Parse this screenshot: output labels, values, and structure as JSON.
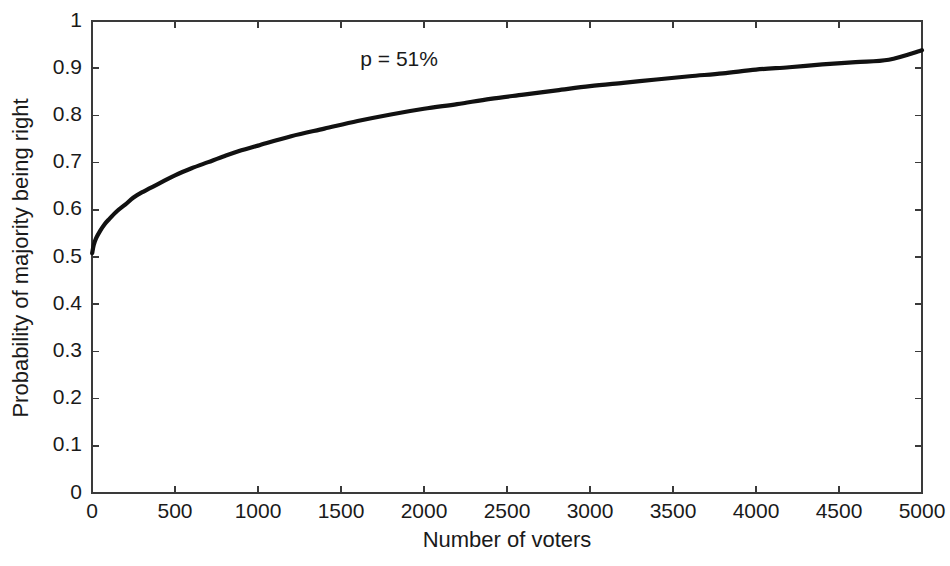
{
  "chart_data": {
    "type": "line",
    "title": "",
    "xlabel": "Number of voters",
    "ylabel": "Probability of majority being right",
    "xlim": [
      0,
      5000
    ],
    "ylim": [
      0,
      1
    ],
    "grid": false,
    "legend": null,
    "xticks": [
      0,
      500,
      1000,
      1500,
      2000,
      2500,
      3000,
      3500,
      4000,
      4500,
      5000
    ],
    "xticklabels": [
      "0",
      "500",
      "1000",
      "1500",
      "2000",
      "2500",
      "3000",
      "3500",
      "4000",
      "4500",
      "5000"
    ],
    "yticks": [
      0,
      0.1,
      0.2,
      0.3,
      0.4,
      0.5,
      0.6,
      0.7,
      0.8,
      0.9,
      1
    ],
    "yticklabels": [
      "0",
      "0.1",
      "0.2",
      "0.3",
      "0.4",
      "0.5",
      "0.6",
      "0.7",
      "0.8",
      "0.9",
      "1"
    ],
    "annotations": [
      {
        "text": "p = 51%",
        "x": 1850,
        "y": 0.905
      }
    ],
    "series": [
      {
        "name": "p = 51%",
        "color": "#111111",
        "linewidth": 4.2,
        "x": [
          1,
          10,
          25,
          50,
          75,
          100,
          150,
          200,
          250,
          300,
          400,
          500,
          600,
          700,
          800,
          900,
          1000,
          1200,
          1400,
          1600,
          1800,
          2000,
          2200,
          2400,
          2600,
          2800,
          3000,
          3200,
          3400,
          3600,
          3800,
          4000,
          4200,
          4400,
          4600,
          4800,
          5000
        ],
        "y": [
          0.508,
          0.525,
          0.54,
          0.556,
          0.569,
          0.579,
          0.597,
          0.611,
          0.626,
          0.637,
          0.655,
          0.673,
          0.688,
          0.701,
          0.714,
          0.726,
          0.736,
          0.756,
          0.772,
          0.788,
          0.802,
          0.814,
          0.824,
          0.835,
          0.844,
          0.853,
          0.862,
          0.869,
          0.876,
          0.883,
          0.889,
          0.897,
          0.902,
          0.908,
          0.913,
          0.918,
          0.938
        ]
      }
    ]
  }
}
